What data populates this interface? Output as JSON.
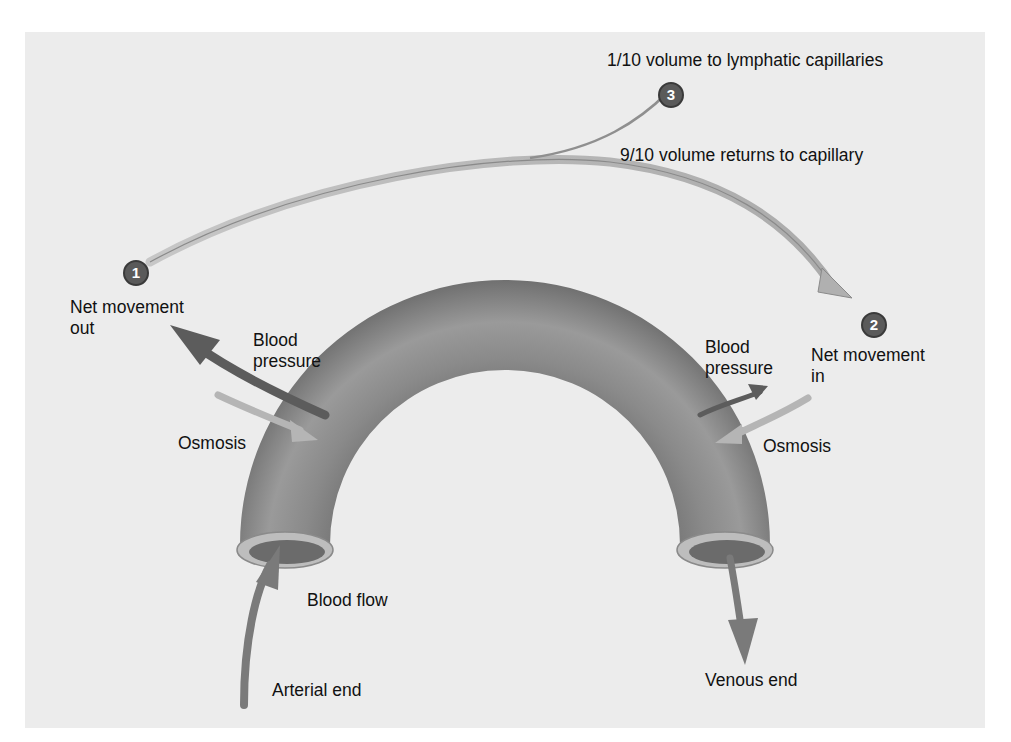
{
  "diagram": {
    "labels": {
      "lymphatic": "1/10 volume to lymphatic capillaries",
      "returns": "9/10 volume returns to capillary",
      "net_out": "Net movement\nout",
      "net_in": "Net movement\nin",
      "bp_left": "Blood\npressure",
      "bp_right": "Blood\npressure",
      "osmosis_left": "Osmosis",
      "osmosis_right": "Osmosis",
      "blood_flow": "Blood flow",
      "arterial_end": "Arterial end",
      "venous_end": "Venous end"
    },
    "steps": [
      {
        "number": "1"
      },
      {
        "number": "2"
      },
      {
        "number": "3"
      }
    ],
    "colors": {
      "background": "#ececec",
      "vessel": "#7a7a7a",
      "badge": "#5a5a5a",
      "arrow_dark": "#5c5c5c",
      "arrow_light": "#b5b5b5"
    }
  }
}
